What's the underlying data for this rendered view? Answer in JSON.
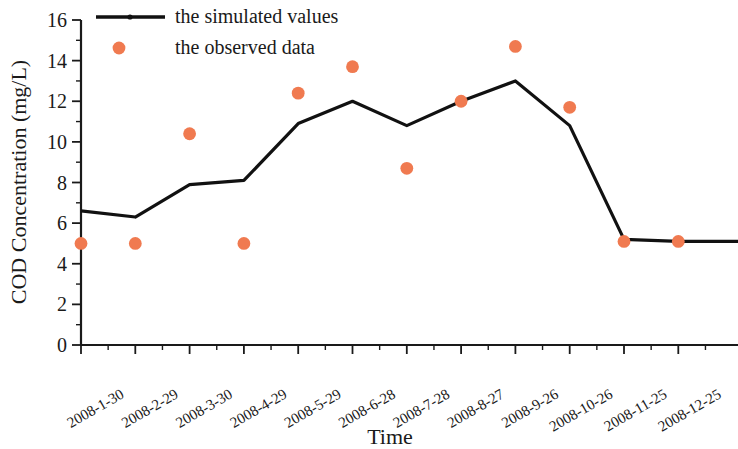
{
  "chart_data": {
    "type": "line",
    "title": "",
    "xlabel": "Time",
    "ylabel": "COD Concentration (mg/L)",
    "ylim": [
      0,
      16
    ],
    "ytick_labels": [
      "0",
      "2",
      "4",
      "6",
      "8",
      "10",
      "12",
      "14",
      "16"
    ],
    "ytick_values": [
      0,
      2,
      4,
      6,
      8,
      10,
      12,
      14,
      16
    ],
    "y_minor_step": 1,
    "grid": false,
    "legend_position": "top-left",
    "categories": [
      "2008-1-30",
      "2008-2-29",
      "2008-3-30",
      "2008-4-29",
      "2008-5-29",
      "2008-6-28",
      "2008-7-28",
      "2008-8-27",
      "2008-9-26",
      "2008-10-26",
      "2008-11-25",
      "2008-12-25"
    ],
    "series": [
      {
        "name": "the simulated values",
        "style": "line",
        "color": "#111111",
        "values": [
          6.6,
          6.3,
          7.9,
          8.1,
          10.9,
          12.0,
          10.8,
          12.0,
          13.0,
          10.8,
          5.2,
          5.1
        ]
      },
      {
        "name": "the observed data",
        "style": "scatter",
        "color": "#F07A50",
        "values": [
          5.0,
          5.0,
          10.4,
          5.0,
          12.4,
          13.7,
          8.7,
          12.0,
          14.7,
          11.7,
          5.1,
          5.1
        ]
      }
    ]
  },
  "legend": {
    "entries": [
      {
        "label": "the simulated values",
        "marker": "line-with-dot",
        "color": "#111111"
      },
      {
        "label": "the observed data",
        "marker": "dot",
        "color": "#F07A50"
      }
    ]
  },
  "colors": {
    "axis": "#1a1a1a",
    "simulated": "#111111",
    "observed": "#F07A50",
    "background": "#ffffff"
  }
}
